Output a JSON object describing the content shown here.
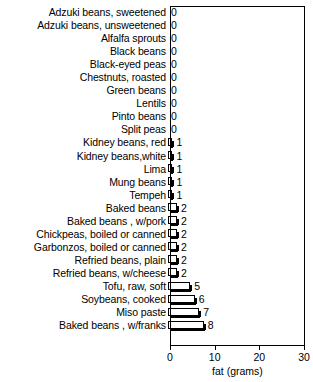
{
  "chart_data": {
    "type": "bar",
    "orientation": "horizontal",
    "title": "",
    "xlabel": "fat (grams)",
    "ylabel": "",
    "xlim": [
      0,
      30
    ],
    "xticks": [
      0,
      10,
      20,
      30
    ],
    "grid": false,
    "legend": null,
    "categories": [
      "Adzuki beans, sweetened",
      "Adzuki beans, unsweetened",
      "Alfalfa sprouts",
      "Black beans",
      "Black-eyed peas",
      "Chestnuts, roasted",
      "Green beans",
      "Lentils",
      "Pinto beans",
      "Split peas",
      "Kidney beans, red",
      "Kidney beans,white",
      "Lima",
      "Mung beans",
      "Tempeh",
      "Baked beans",
      "Baked beans , w/pork",
      "Chickpeas, boiled or canned",
      "Garbonzos, boiled or canned",
      "Refried beans, plain",
      "Refried beans, w/cheese",
      "Tofu, raw, soft",
      "Soybeans, cooked",
      "Miso paste",
      "Baked beans , w/franks"
    ],
    "values": [
      0,
      0,
      0,
      0,
      0,
      0,
      0,
      0,
      0,
      0,
      1,
      1,
      1,
      1,
      1,
      2,
      2,
      2,
      2,
      2,
      2,
      5,
      6,
      7,
      8
    ],
    "value_labels": [
      "0",
      "0",
      "0",
      "0",
      "0",
      "0",
      "0",
      "0",
      "0",
      "0",
      "1",
      "1",
      "1",
      "1",
      "1",
      "2",
      "2",
      "2",
      "2",
      "2",
      "2",
      "5",
      "6",
      "7",
      "8"
    ],
    "xtick_labels": [
      "0",
      "10",
      "20",
      "30"
    ]
  },
  "axis": {
    "xlabel": "fat (grams)"
  }
}
